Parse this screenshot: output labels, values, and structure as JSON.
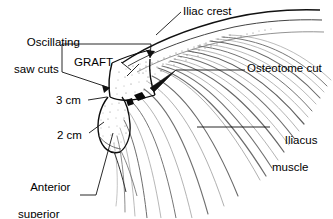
{
  "figure": {
    "kind": "anatomical-line-drawing",
    "width": 333,
    "height": 218,
    "background_color": "#ffffff",
    "ink_color": "#000000",
    "muscle_fiber_color": "#555555"
  },
  "labels": {
    "oscillating_saw_cuts": {
      "line1": "Oscillating",
      "line2": "saw cuts"
    },
    "graft": "GRAFT",
    "measure_3cm": "3 cm",
    "measure_2cm": "2 cm",
    "anterior_superior_iliac_spine": {
      "line1": "Anterior",
      "line2": "superior",
      "line3": "iliac spine"
    },
    "iliac_crest": "Iliac crest",
    "osteotome_cut": "Osteotome cut",
    "iliacus_muscle": {
      "line1": "Iliacus",
      "line2": "muscle"
    }
  }
}
